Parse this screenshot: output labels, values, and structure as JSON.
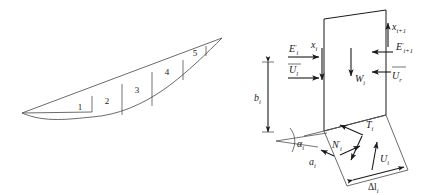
{
  "figure": {
    "background_color": "#ffffff",
    "line_color": "#5a5a5a",
    "label_color": "#1a1a1a"
  },
  "left_panel": {
    "name": "sliding-mass-slices",
    "description": "Slope cross-section divided into vertical slices along a slip surface",
    "slice_labels": [
      "1",
      "2",
      "3",
      "4",
      "5"
    ],
    "slice_count": 5
  },
  "right_panel": {
    "name": "slice-free-body",
    "description": "Free body diagram of a single slice i with interslice and base forces",
    "forces": {
      "left_normal": "E",
      "left_normal_prime": "′",
      "left_normal_sub": "i",
      "left_shear": "x",
      "left_shear_sub": "i",
      "left_water": "U",
      "left_water_sub": "l",
      "weight": "W",
      "weight_sub": "i",
      "right_shear": "x",
      "right_shear_sub": "i+1",
      "right_normal": "E",
      "right_normal_prime": "′",
      "right_normal_sub": "i+1",
      "right_water": "U",
      "right_water_sub": "r",
      "base_shear": "T",
      "base_shear_sub": "i",
      "base_normal": "N",
      "base_normal_prime": "′",
      "base_normal_sub": "i",
      "base_water": "U",
      "base_water_sub": "i"
    },
    "dimensions": {
      "height": "b",
      "height_sub": "i",
      "base_offset": "a",
      "base_offset_sub": "i",
      "base_length": "Δl",
      "base_length_sub": "i",
      "base_angle": "α",
      "base_angle_sub": "i"
    }
  }
}
